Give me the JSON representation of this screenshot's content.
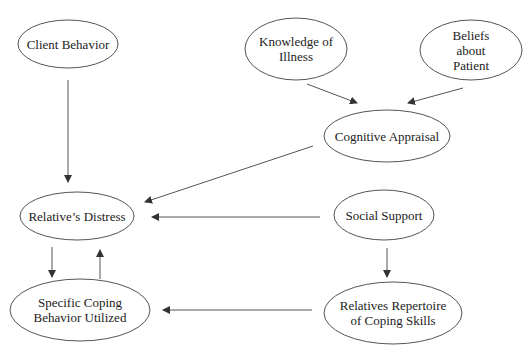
{
  "diagram": {
    "nodes": [
      {
        "id": "client-behavior",
        "label": "Client Behavior",
        "cx": 68,
        "cy": 44,
        "rx": 50,
        "ry": 24
      },
      {
        "id": "knowledge-of-illness",
        "label": "Knowledge of\nIllness",
        "cx": 296,
        "cy": 49,
        "rx": 51,
        "ry": 31
      },
      {
        "id": "beliefs-about-patient",
        "label": "Beliefs about\nPatient",
        "cx": 471,
        "cy": 50,
        "rx": 51,
        "ry": 30
      },
      {
        "id": "cognitive-appraisal",
        "label": "Cognitive Appraisal",
        "cx": 387,
        "cy": 136,
        "rx": 63,
        "ry": 26
      },
      {
        "id": "relatives-distress",
        "label": "Relative’s Distress",
        "cx": 77,
        "cy": 216,
        "rx": 57,
        "ry": 24
      },
      {
        "id": "social-support",
        "label": "Social Support",
        "cx": 384,
        "cy": 215,
        "rx": 50,
        "ry": 25
      },
      {
        "id": "specific-coping-behavior",
        "label": "Specific Coping\nBehavior Utilized",
        "cx": 80,
        "cy": 310,
        "rx": 70,
        "ry": 31
      },
      {
        "id": "relatives-repertoire",
        "label": "Relatives Repertoire\nof Coping Skills",
        "cx": 393,
        "cy": 313,
        "rx": 69,
        "ry": 31
      }
    ],
    "edges": [
      {
        "from": "client-behavior",
        "to": "relatives-distress",
        "x1": 68,
        "y1": 80,
        "x2": 68,
        "y2": 182
      },
      {
        "from": "knowledge-of-illness",
        "to": "cognitive-appraisal",
        "x1": 307,
        "y1": 84,
        "x2": 357,
        "y2": 103
      },
      {
        "from": "beliefs-about-patient",
        "to": "cognitive-appraisal",
        "x1": 463,
        "y1": 88,
        "x2": 408,
        "y2": 103
      },
      {
        "from": "cognitive-appraisal",
        "to": "relatives-distress",
        "x1": 313,
        "y1": 146,
        "x2": 145,
        "y2": 202
      },
      {
        "from": "social-support",
        "to": "relatives-distress",
        "x1": 320,
        "y1": 217,
        "x2": 152,
        "y2": 217
      },
      {
        "from": "relatives-distress",
        "to": "specific-coping-behavior",
        "x1": 52,
        "y1": 247,
        "x2": 52,
        "y2": 277
      },
      {
        "from": "specific-coping-behavior",
        "to": "relatives-distress",
        "x1": 100,
        "y1": 279,
        "x2": 100,
        "y2": 250
      },
      {
        "from": "social-support",
        "to": "relatives-repertoire",
        "x1": 387,
        "y1": 248,
        "x2": 387,
        "y2": 277
      },
      {
        "from": "relatives-repertoire",
        "to": "specific-coping-behavior",
        "x1": 312,
        "y1": 310,
        "x2": 163,
        "y2": 310
      }
    ],
    "colors": {
      "stroke": "#555555",
      "arrow": "#333333",
      "text": "#222222",
      "background": "#ffffff"
    }
  }
}
